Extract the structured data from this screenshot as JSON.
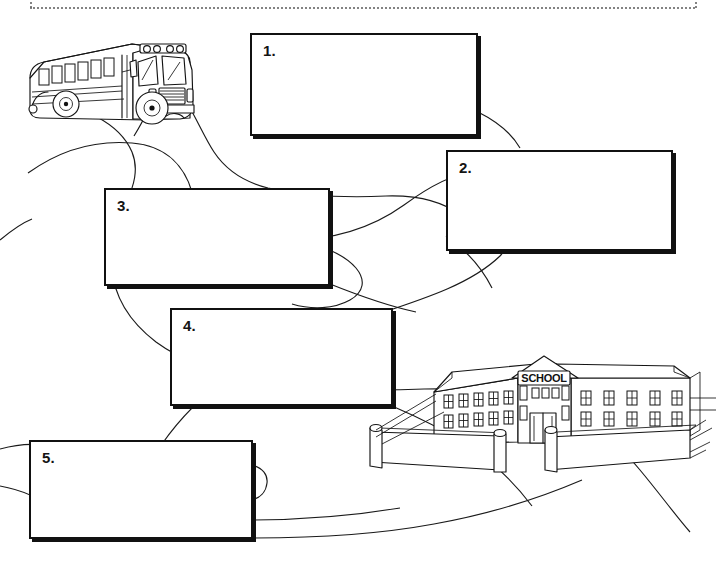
{
  "page": {
    "background_color": "#ffffff",
    "ink_color": "#141414",
    "cut_line": "dotted-cut-line"
  },
  "illustrations": [
    {
      "name": "school-bus",
      "label": "School Bus",
      "x": 18,
      "y": 30,
      "width": 190,
      "height": 110
    },
    {
      "name": "winding-road",
      "label": "Winding Road",
      "x": 0,
      "y": 95,
      "width": 721,
      "height": 450
    },
    {
      "name": "school-building",
      "label": "School Building",
      "x": 368,
      "y": 360,
      "width": 335,
      "height": 130,
      "sign_text": "SCHOOL"
    }
  ],
  "boxes": [
    {
      "id": "box-1",
      "number": "1.",
      "value": "",
      "placeholder": "",
      "x": 250,
      "y": 33,
      "width": 228,
      "height": 103
    },
    {
      "id": "box-2",
      "number": "2.",
      "value": "",
      "placeholder": "",
      "x": 446,
      "y": 150,
      "width": 227,
      "height": 101
    },
    {
      "id": "box-3",
      "number": "3.",
      "value": "",
      "placeholder": "",
      "x": 104,
      "y": 188,
      "width": 226,
      "height": 98
    },
    {
      "id": "box-4",
      "number": "4.",
      "value": "",
      "placeholder": "",
      "x": 170,
      "y": 308,
      "width": 223,
      "height": 98
    },
    {
      "id": "box-5",
      "number": "5.",
      "value": "",
      "placeholder": "",
      "x": 29,
      "y": 440,
      "width": 224,
      "height": 99
    }
  ]
}
